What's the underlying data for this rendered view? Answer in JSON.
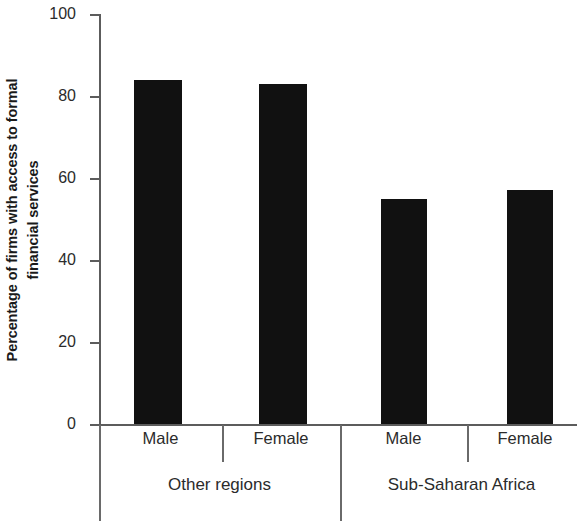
{
  "chart_data": {
    "type": "bar",
    "title": "",
    "subtitle": "",
    "xlabel": "",
    "ylabel": "Percentage of firms with access to formal financial services",
    "ylabel_lines": [
      "Percentage of firms with access to formal",
      "financial services"
    ],
    "ylim": [
      0,
      100
    ],
    "yticks": [
      0,
      20,
      40,
      60,
      80,
      100
    ],
    "ytick_labels": [
      "0",
      "20",
      "40",
      "60",
      "80",
      "100"
    ],
    "grid": false,
    "legend": null,
    "bar_color": "#111111",
    "axis_color": "#5c5c5c",
    "categories": [
      "Male",
      "Female",
      "Male",
      "Female"
    ],
    "groups": [
      {
        "label": "Other regions",
        "categories": [
          "Male",
          "Female"
        ]
      },
      {
        "label": "Sub-Saharan Africa",
        "categories": [
          "Male",
          "Female"
        ]
      }
    ],
    "values": [
      84,
      83,
      55,
      57
    ],
    "bars": [
      {
        "group": "Other regions",
        "category": "Male",
        "value": 84
      },
      {
        "group": "Other regions",
        "category": "Female",
        "value": 83
      },
      {
        "group": "Sub-Saharan Africa",
        "category": "Male",
        "value": 55
      },
      {
        "group": "Sub-Saharan Africa",
        "category": "Female",
        "value": 57
      }
    ]
  }
}
